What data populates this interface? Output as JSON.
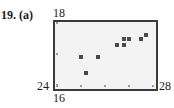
{
  "problem_label": "19. (a)",
  "chart_data": {
    "type": "scatter",
    "title": "",
    "xlabel": "",
    "ylabel": "",
    "xlim": [
      24,
      28
    ],
    "ylim": [
      16,
      18
    ],
    "x_tick_labels": [
      "24",
      "28"
    ],
    "y_tick_labels": [
      "16",
      "18"
    ],
    "x_ticks": [
      24,
      25,
      26,
      27,
      28
    ],
    "y_ticks": [
      16,
      17,
      18
    ],
    "grid": false,
    "points": [
      {
        "x": 25.0,
        "y": 16.9
      },
      {
        "x": 25.7,
        "y": 16.9
      },
      {
        "x": 25.2,
        "y": 16.4
      },
      {
        "x": 26.5,
        "y": 17.3
      },
      {
        "x": 26.8,
        "y": 17.3
      },
      {
        "x": 26.8,
        "y": 17.5
      },
      {
        "x": 27.0,
        "y": 17.5
      },
      {
        "x": 27.5,
        "y": 17.5
      },
      {
        "x": 27.7,
        "y": 17.6
      }
    ]
  },
  "labels": {
    "y_max": "18",
    "y_min": "16",
    "x_min": "24",
    "x_max": "28"
  },
  "colors": {
    "frame": "#3a3a3a",
    "plot_bg": "#f3f3f3",
    "point": "#4a4a4a"
  }
}
